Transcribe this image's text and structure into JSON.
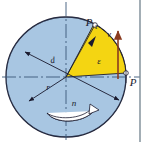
{
  "figure": {
    "type": "technical-diagram",
    "colors": {
      "disc_fill": "#a8c6e2",
      "disc_stroke": "#1a1a2e",
      "sector_fill": "#f4d512",
      "sector_stroke": "#1a1a2e",
      "velocity_arrow": "#8a3b20",
      "axis_line": "#3b5878",
      "frame_border": "#7b8b96",
      "background": "#ffffff",
      "label_color": "#1a1a2e"
    },
    "geometry": {
      "center_x": 66,
      "center_y": 77,
      "radius": 60,
      "sector_start_angle_deg": -4,
      "sector_end_angle_deg": -62,
      "velocity_arrow_x": 118,
      "velocity_arrow_top_y": 30,
      "velocity_arrow_bottom_y": 77
    },
    "labels": [
      {
        "id": "point-p1",
        "text": "P",
        "sub": "1",
        "x": 90,
        "y": 27,
        "kind": "point-label"
      },
      {
        "id": "velocity",
        "text": "v",
        "x": 109,
        "y": 36,
        "kind": "vector-label"
      },
      {
        "id": "angle-epsilon",
        "text": "ε",
        "x": 97,
        "y": 62,
        "kind": "angle-label"
      },
      {
        "id": "diameter-d",
        "text": "d",
        "x": 52,
        "y": 62,
        "kind": "dimension-label"
      },
      {
        "id": "radius-r",
        "text": "r",
        "x": 47,
        "y": 88,
        "kind": "dimension-label"
      },
      {
        "id": "rotation-n",
        "text": "n",
        "x": 73,
        "y": 104,
        "kind": "rotation-label"
      },
      {
        "id": "point-p",
        "text": "P",
        "x": 133,
        "y": 84,
        "kind": "point-label"
      }
    ],
    "elements": {
      "disc": "circular-disc",
      "sector": "highlighted-angular-sector",
      "horizontal_axis": "dash-dot-horizontal-centerline",
      "vertical_axis": "dash-dot-vertical-centerline",
      "diameter_arrow": "double-headed-diameter-arrow",
      "radius_arrow": "double-headed-radius-arrow",
      "rotation_arrow": "curved-rotation-arrow",
      "velocity_vector": "upward-velocity-arrow",
      "point_marker_p": "white-circle-marker-at-p",
      "point_marker_p1": "white-circle-marker-at-p1",
      "frame": "right-vertical-frame-line"
    }
  }
}
